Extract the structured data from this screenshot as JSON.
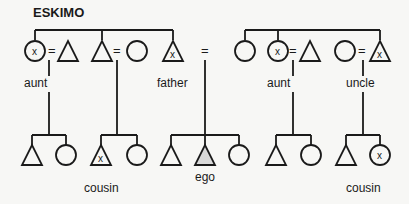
{
  "title": "ESKIMO",
  "colors": {
    "background": "#f7f7f5",
    "ink": "#1a1a1a",
    "ego_fill": "#d9d9d9"
  },
  "labels": {
    "aunt_left": "aunt",
    "father": "father",
    "aunt_right": "aunt",
    "uncle": "uncle",
    "cousin_left": "cousin",
    "ego": "ego",
    "cousin_right": "cousin"
  },
  "marks": {
    "x": "x",
    "equals": "="
  },
  "legend_semantics": {
    "triangle": "male",
    "circle": "female",
    "equals": "marriage",
    "x": "marked relative"
  }
}
